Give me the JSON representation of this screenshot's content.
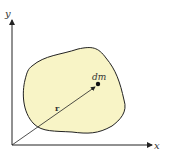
{
  "diagram": {
    "axes": {
      "x_label": "x",
      "y_label": "y"
    },
    "body": {
      "fill": "#f8f4c6",
      "stroke": "#222222"
    },
    "mass_element_label": "dm",
    "position_vector_label": "r"
  }
}
